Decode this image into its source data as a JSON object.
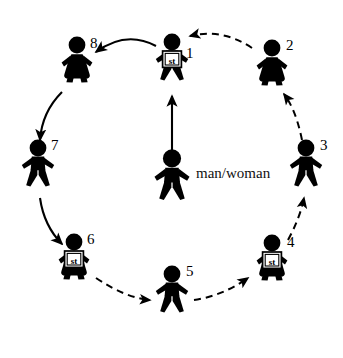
{
  "diagram": {
    "type": "circular-sequence-diagram",
    "center": {
      "label": "man/woman",
      "figure_kind": "man",
      "icon": "person-man-icon"
    },
    "sign_text": "st",
    "colors": {
      "figure": "#000000",
      "background": "#ffffff",
      "arrow": "#000000",
      "sign_fill": "#ffffff",
      "sign_border": "#000000"
    },
    "positions": [
      {
        "number": "1",
        "kind": "man",
        "has_sign": true,
        "cx": 172,
        "cy": 62,
        "label_dx": 14,
        "label_dy": 10
      },
      {
        "number": "2",
        "kind": "woman",
        "has_sign": false,
        "cx": 272,
        "cy": 68,
        "label_dx": 14,
        "label_dy": -4
      },
      {
        "number": "3",
        "kind": "man",
        "has_sign": false,
        "cx": 306,
        "cy": 168,
        "label_dx": 14,
        "label_dy": -4
      },
      {
        "number": "4",
        "kind": "woman",
        "has_sign": true,
        "cx": 272,
        "cy": 263,
        "label_dx": 15,
        "label_dy": -2
      },
      {
        "number": "5",
        "kind": "man",
        "has_sign": false,
        "cx": 172,
        "cy": 294,
        "label_dx": 14,
        "label_dy": -4
      },
      {
        "number": "6",
        "kind": "woman",
        "has_sign": true,
        "cx": 74,
        "cy": 262,
        "label_dx": 13,
        "label_dy": -4
      },
      {
        "number": "7",
        "kind": "man",
        "has_sign": false,
        "cx": 38,
        "cy": 168,
        "label_dx": 13,
        "label_dy": -4
      },
      {
        "number": "8",
        "kind": "woman",
        "has_sign": false,
        "cx": 77,
        "cy": 65,
        "label_dx": 13,
        "label_dy": -3
      }
    ],
    "arrows": [
      {
        "name": "arrow-center-to-1",
        "style": "solid",
        "from": "center",
        "to": "1"
      },
      {
        "name": "arrow-1-to-8",
        "style": "solid",
        "from": "1",
        "to": "8"
      },
      {
        "name": "arrow-8-to-7",
        "style": "solid",
        "from": "8",
        "to": "7"
      },
      {
        "name": "arrow-7-to-6",
        "style": "solid",
        "from": "7",
        "to": "6"
      },
      {
        "name": "arrow-6-to-5",
        "style": "dashed",
        "from": "6",
        "to": "5"
      },
      {
        "name": "arrow-5-to-4",
        "style": "dashed",
        "from": "5",
        "to": "4"
      },
      {
        "name": "arrow-4-to-3",
        "style": "dashed",
        "from": "4",
        "to": "3"
      },
      {
        "name": "arrow-3-to-2",
        "style": "dashed",
        "from": "3",
        "to": "2"
      },
      {
        "name": "arrow-2-to-1",
        "style": "dashed",
        "from": "2",
        "to": "1"
      }
    ],
    "center_label_pos": {
      "x": 196,
      "y": 166
    }
  }
}
